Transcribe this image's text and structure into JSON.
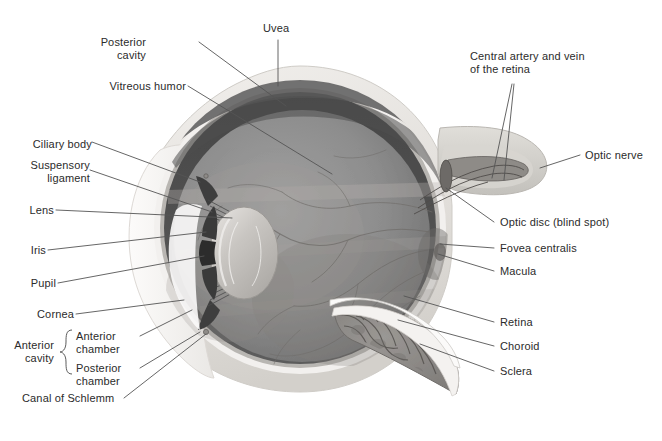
{
  "figure": {
    "type": "anatomical-illustration",
    "background_color": "#ffffff",
    "text_color": "#2b2b2b",
    "leader_line_color": "#555555"
  },
  "palette": {
    "sclera_outer": "#ece9e6",
    "sclera_mid": "#dcd9d5",
    "pale_band": "#f4f2f0",
    "uvea_dark": "#4e4e4e",
    "retina_band": "#6e6e6e",
    "vitreous_light": "#9a9a9a",
    "vitreous_mid": "#8a8a8a",
    "vitreous_dark": "#6f6f6f",
    "lens_light": "#d5d2cf",
    "lens_mid": "#b9b6b2",
    "iris_dark": "#3b3b3b",
    "pupil": "#2d2d2d",
    "cornea": "#f7f6f5",
    "vessel": "#7b7b7b",
    "choroid_flap": "#8d8b88",
    "optic_nerve": "#cfcdc9"
  },
  "labels": {
    "left": [
      {
        "id": "posterior-cavity",
        "text": "Posterior\ncavity",
        "x": 146,
        "y": 36
      },
      {
        "id": "vitreous-humor",
        "text": "Vitreous humor",
        "x": 100,
        "y": 80
      },
      {
        "id": "ciliary-body",
        "text": "Ciliary body",
        "x": 25,
        "y": 138
      },
      {
        "id": "suspensory-ligament",
        "text": "Suspensory\nligament",
        "x": 24,
        "y": 166
      },
      {
        "id": "lens",
        "text": "Lens",
        "x": 26,
        "y": 206
      },
      {
        "id": "iris",
        "text": "Iris",
        "x": 26,
        "y": 246
      },
      {
        "id": "pupil",
        "text": "Pupil",
        "x": 26,
        "y": 279
      },
      {
        "id": "cornea",
        "text": "Cornea",
        "x": 26,
        "y": 310
      },
      {
        "id": "anterior-cavity",
        "text": "Anterior\ncavity",
        "x": 24,
        "y": 346
      },
      {
        "id": "anterior-chamber",
        "text": "Anterior\nchamber",
        "x": 78,
        "y": 332
      },
      {
        "id": "posterior-chamber",
        "text": "Posterior\nchamber",
        "x": 78,
        "y": 364
      },
      {
        "id": "canal-of-schlemm",
        "text": "Canal of Schlemm",
        "x": 24,
        "y": 395
      }
    ],
    "top": [
      {
        "id": "uvea",
        "text": "Uvea",
        "x": 263,
        "y": 24
      },
      {
        "id": "central-artery-vein",
        "text": "Central artery and vein\nof the retina",
        "x": 470,
        "y": 57
      }
    ],
    "right": [
      {
        "id": "optic-nerve",
        "text": "Optic nerve",
        "x": 585,
        "y": 151
      },
      {
        "id": "optic-disc",
        "text": "Optic disc (blind spot)",
        "x": 498,
        "y": 219
      },
      {
        "id": "fovea-centralis",
        "text": "Fovea centralis",
        "x": 498,
        "y": 245
      },
      {
        "id": "macula",
        "text": "Macula",
        "x": 498,
        "y": 268
      },
      {
        "id": "retina",
        "text": "Retina",
        "x": 498,
        "y": 319
      },
      {
        "id": "choroid",
        "text": "Choroid",
        "x": 498,
        "y": 343
      },
      {
        "id": "sclera",
        "text": "Sclera",
        "x": 498,
        "y": 368
      }
    ]
  }
}
